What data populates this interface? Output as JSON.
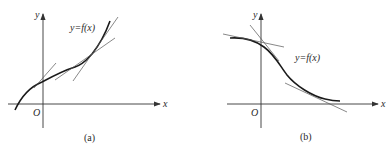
{
  "figure": {
    "panels": [
      {
        "id": "a",
        "caption": "(a)",
        "function_label": "y=f(x)",
        "x_axis_label": "x",
        "y_axis_label": "y",
        "origin_label": "O",
        "description": "Increasing curve with tangent lines at several points"
      },
      {
        "id": "b",
        "caption": "(b)",
        "function_label": "y=f(x)",
        "x_axis_label": "x",
        "y_axis_label": "y",
        "origin_label": "O",
        "description": "Decreasing curve with tangent lines at several points"
      }
    ],
    "colors": {
      "curve": "#1a1a1a",
      "tangent": "#555555",
      "axis": "#333333",
      "background": "#ffffff"
    }
  }
}
